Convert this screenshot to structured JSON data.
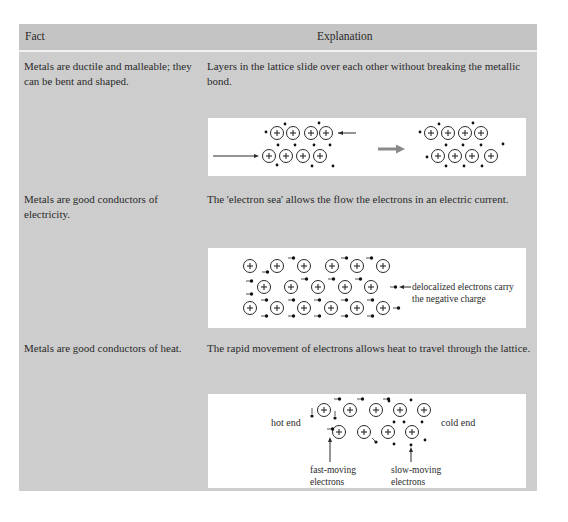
{
  "table": {
    "headers": {
      "fact": "Fact",
      "explanation": "Explanation"
    },
    "rows": [
      {
        "fact": "Metals are ductile and malleable; they can be bent and shaped.",
        "explanation": "Layers in the lattice slide over each other without breaking the metallic bond.",
        "diagram": "layers-sliding",
        "diagram_labels": {}
      },
      {
        "fact": "Metals are good conductors of electricity.",
        "explanation": "The 'electron sea' allows the flow the electrons in an electric current.",
        "diagram": "electron-flow",
        "diagram_labels": {
          "annotation_line1": "delocalized electrons carry",
          "annotation_line2": "the negative charge"
        }
      },
      {
        "fact": "Metals are good conductors of heat.",
        "explanation": "The rapid movement of electrons allows heat to travel through the lattice.",
        "diagram": "heat-conduction",
        "diagram_labels": {
          "hot_end": "hot end",
          "cold_end": "cold end",
          "fast_line1": "fast-moving",
          "fast_line2": "electrons",
          "slow_line1": "slow-moving",
          "slow_line2": "electrons"
        }
      }
    ]
  },
  "symbols": {
    "ion": "+"
  },
  "colors": {
    "table_bg": "#cdcdcd",
    "header_bg": "#c4c4c4",
    "diagram_bg": "#ffffff",
    "ink": "#2a2a2a",
    "arrow_gray": "#8a8a8a"
  }
}
